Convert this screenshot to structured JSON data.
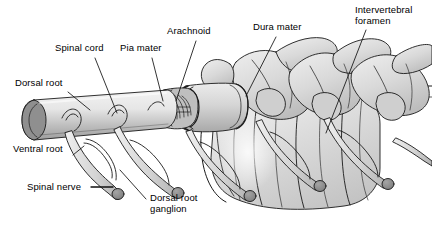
{
  "figure": {
    "background_color": "#ffffff",
    "width": 432,
    "height": 238
  },
  "palette": {
    "outline": "#1a1a1a",
    "cord_light": "#e8e8e8",
    "cord_mid": "#c9c9c9",
    "cord_dark": "#9a9a9a",
    "cut_face": "#8e8e8e",
    "bone_light": "#e6e6e6",
    "bone_mid": "#cfcfcf",
    "bone_shadow": "#b5b5b5",
    "nerve_fill": "#d6d6d6",
    "ganglion_fill": "#8a8a8a",
    "dura_fill": "#d2d2d2",
    "arachnoid_fill": "#bdbdbd",
    "leader_line": "#111111",
    "text": "#000000"
  },
  "labels": [
    {
      "id": "dorsal-root",
      "text": "Dorsal root",
      "x": 15,
      "y": 83,
      "leader": {
        "x1": 68,
        "y1": 92,
        "x2": 90,
        "y2": 110
      }
    },
    {
      "id": "spinal-cord",
      "text": "Spinal cord",
      "x": 55,
      "y": 48,
      "leader": {
        "x1": 95,
        "y1": 58,
        "x2": 117,
        "y2": 113
      }
    },
    {
      "id": "pia-mater",
      "text": "Pia mater",
      "x": 120,
      "y": 48,
      "leader": {
        "x1": 152,
        "y1": 58,
        "x2": 163,
        "y2": 101
      }
    },
    {
      "id": "arachnoid",
      "text": "Arachnoid",
      "x": 167,
      "y": 31,
      "leader": {
        "x1": 196,
        "y1": 41,
        "x2": 176,
        "y2": 101
      }
    },
    {
      "id": "dura-mater",
      "text": "Dura mater",
      "x": 253,
      "y": 27,
      "leader": {
        "x1": 276,
        "y1": 37,
        "x2": 246,
        "y2": 96
      }
    },
    {
      "id": "intervertebral-foramen",
      "text": "Intervertebral\nforamen",
      "x": 355,
      "y": 8,
      "leader": {
        "x1": 366,
        "y1": 30,
        "x2": 326,
        "y2": 133
      }
    },
    {
      "id": "ventral-root",
      "text": "Ventral root",
      "x": 13,
      "y": 148,
      "leader": {
        "x1": 73,
        "y1": 155,
        "x2": 84,
        "y2": 146
      }
    },
    {
      "id": "spinal-nerve",
      "text": "Spinal nerve",
      "x": 27,
      "y": 182,
      "leader": {
        "x1": 91,
        "y1": 187,
        "x2": 113,
        "y2": 187
      }
    },
    {
      "id": "dorsal-root-ganglion",
      "text": "Dorsal root\nganglion",
      "x": 150,
      "y": 195,
      "leader": {
        "x1": 146,
        "y1": 199,
        "x2": 120,
        "y2": 170
      }
    }
  ],
  "anatomy": {
    "spinal_cord": {
      "name": "spinal-cord",
      "description": "Cut cylindrical cord running from lower-left to mid-right"
    },
    "meninges": [
      {
        "name": "pia-mater",
        "order": 1
      },
      {
        "name": "arachnoid",
        "order": 2
      },
      {
        "name": "dura-mater",
        "order": 3
      }
    ],
    "nerve_pairs": 5,
    "ganglion_count": 5,
    "vertebra_count": 3
  }
}
